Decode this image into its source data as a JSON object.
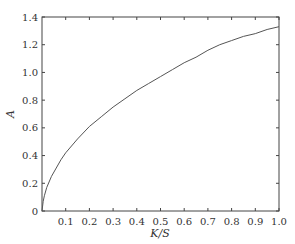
{
  "chart_data": {
    "type": "line",
    "title": "",
    "xlabel": "K/S",
    "ylabel": "A",
    "xlim": [
      0,
      1.0
    ],
    "ylim": [
      0,
      1.4
    ],
    "grid": false,
    "legend": null,
    "xticks": [
      "0.1",
      "0.2",
      "0.3",
      "0.4",
      "0.5",
      "0.6",
      "0.7",
      "0.8",
      "0.9",
      "1.0"
    ],
    "yticks": [
      "0",
      "0.2",
      "0.4",
      "0.6",
      "0.8",
      "1.0",
      "1.2",
      "1.4"
    ],
    "series": [
      {
        "name": "A",
        "color": "#555555",
        "x": [
          0,
          0.005,
          0.01,
          0.02,
          0.04,
          0.06,
          0.08,
          0.1,
          0.15,
          0.2,
          0.25,
          0.3,
          0.35,
          0.4,
          0.45,
          0.5,
          0.55,
          0.6,
          0.65,
          0.7,
          0.75,
          0.8,
          0.85,
          0.9,
          0.95,
          1.0
        ],
        "values": [
          0,
          0.07,
          0.11,
          0.17,
          0.25,
          0.31,
          0.37,
          0.42,
          0.52,
          0.61,
          0.68,
          0.75,
          0.81,
          0.87,
          0.92,
          0.97,
          1.02,
          1.07,
          1.11,
          1.16,
          1.2,
          1.23,
          1.26,
          1.28,
          1.31,
          1.33
        ]
      }
    ]
  }
}
